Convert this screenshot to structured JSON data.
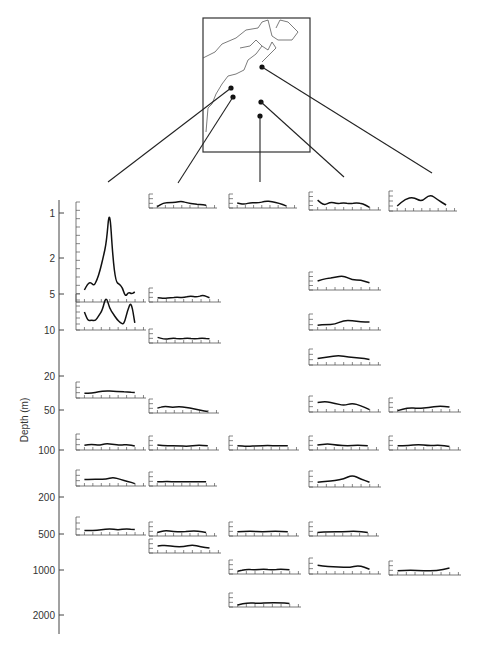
{
  "page_header": {
    "left": "",
    "center": ""
  },
  "chart_data": {
    "type": "line",
    "title": "",
    "xlabel": "",
    "ylabel": "Depth (m)",
    "yscale": "log-like (categorical ticks)",
    "y_ticks": [
      {
        "label": "1",
        "y": 213
      },
      {
        "label": "2",
        "y": 258
      },
      {
        "label": "5",
        "y": 294
      },
      {
        "label": "10",
        "y": 330
      },
      {
        "label": "20",
        "y": 376
      },
      {
        "label": "50",
        "y": 410
      },
      {
        "label": "100",
        "y": 450
      },
      {
        "label": "200",
        "y": 497
      },
      {
        "label": "500",
        "y": 534
      },
      {
        "label": "1000",
        "y": 570
      },
      {
        "label": "2000",
        "y": 615
      }
    ],
    "map": {
      "box": [
        203,
        18,
        310,
        152
      ],
      "stations": [
        {
          "id": "A",
          "x": 231,
          "y": 88,
          "column": 0
        },
        {
          "id": "B",
          "x": 233,
          "y": 97,
          "column": 1
        },
        {
          "id": "C",
          "x": 260,
          "y": 116,
          "column": 2
        },
        {
          "id": "D",
          "x": 261,
          "y": 102,
          "column": 3
        },
        {
          "id": "E",
          "x": 262,
          "y": 67,
          "column": 4
        }
      ],
      "leader_ends": [
        [
          108,
          182
        ],
        [
          178,
          183
        ],
        [
          260,
          182
        ],
        [
          344,
          177
        ],
        [
          432,
          173
        ]
      ]
    },
    "columns": [
      {
        "station": "A",
        "x": 76
      },
      {
        "station": "B",
        "x": 149
      },
      {
        "station": "C",
        "x": 228
      },
      {
        "station": "D",
        "x": 309
      },
      {
        "station": "E",
        "x": 389
      }
    ],
    "panels": [
      {
        "col": 0,
        "x": 76,
        "base": 302,
        "h": 100,
        "w": 70,
        "xticks": 8,
        "yticks": 12,
        "values": [
          0.12,
          0.18,
          0.2,
          0.16,
          0.22,
          0.32,
          0.45,
          0.6,
          0.95,
          0.45,
          0.2,
          0.18,
          0.15,
          0.05,
          0.1,
          0.08,
          0.1
        ]
      },
      {
        "col": 0,
        "x": 76,
        "base": 330,
        "h": 36,
        "w": 70,
        "xticks": 8,
        "yticks": 6,
        "values": [
          0.5,
          0.25,
          0.28,
          0.25,
          0.4,
          0.55,
          0.95,
          0.6,
          0.45,
          0.3,
          0.2,
          0.15,
          0.55,
          0.8,
          0.2
        ]
      },
      {
        "col": 0,
        "x": 76,
        "base": 398,
        "h": 16,
        "w": 70,
        "xticks": 8,
        "yticks": 3,
        "values": [
          0.3,
          0.3,
          0.4,
          0.45,
          0.42,
          0.4,
          0.38,
          0.35
        ]
      },
      {
        "col": 0,
        "x": 76,
        "base": 450,
        "h": 16,
        "w": 70,
        "xticks": 8,
        "yticks": 3,
        "values": [
          0.3,
          0.35,
          0.3,
          0.4,
          0.35,
          0.3,
          0.35,
          0.25
        ]
      },
      {
        "col": 0,
        "x": 76,
        "base": 486,
        "h": 16,
        "w": 70,
        "xticks": 8,
        "yticks": 3,
        "values": [
          0.4,
          0.42,
          0.42,
          0.42,
          0.55,
          0.4,
          0.3,
          0.15
        ]
      },
      {
        "col": 0,
        "x": 76,
        "base": 535,
        "h": 18,
        "w": 70,
        "xticks": 8,
        "yticks": 3,
        "values": [
          0.25,
          0.25,
          0.28,
          0.35,
          0.28,
          0.35,
          0.3
        ]
      },
      {
        "col": 1,
        "x": 149,
        "base": 208,
        "h": 14,
        "w": 68,
        "xticks": 8,
        "yticks": 3,
        "values": [
          0.1,
          0.35,
          0.4,
          0.4,
          0.5,
          0.35,
          0.3,
          0.25,
          0.2
        ]
      },
      {
        "col": 1,
        "x": 149,
        "base": 302,
        "h": 14,
        "w": 72,
        "xticks": 8,
        "yticks": 3,
        "values": [
          0.3,
          0.25,
          0.3,
          0.35,
          0.3,
          0.45,
          0.35,
          0.5,
          0.3
        ]
      },
      {
        "col": 1,
        "x": 149,
        "base": 343,
        "h": 14,
        "w": 72,
        "xticks": 8,
        "yticks": 3,
        "values": [
          0.4,
          0.25,
          0.35,
          0.3,
          0.35,
          0.3,
          0.35,
          0.3
        ]
      },
      {
        "col": 1,
        "x": 149,
        "base": 413,
        "h": 14,
        "w": 70,
        "xticks": 8,
        "yticks": 3,
        "values": [
          0.35,
          0.5,
          0.4,
          0.45,
          0.4,
          0.3,
          0.2,
          0.1
        ]
      },
      {
        "col": 1,
        "x": 149,
        "base": 450,
        "h": 14,
        "w": 70,
        "xticks": 8,
        "yticks": 3,
        "values": [
          0.35,
          0.3,
          0.3,
          0.25,
          0.35,
          0.3
        ]
      },
      {
        "col": 1,
        "x": 149,
        "base": 486,
        "h": 14,
        "w": 68,
        "xticks": 8,
        "yticks": 3,
        "values": [
          0.3,
          0.32,
          0.3,
          0.3,
          0.3,
          0.3
        ]
      },
      {
        "col": 1,
        "x": 149,
        "base": 536,
        "h": 14,
        "w": 68,
        "xticks": 8,
        "yticks": 3,
        "values": [
          0.25,
          0.4,
          0.3,
          0.3,
          0.35,
          0.35,
          0.25
        ]
      },
      {
        "col": 1,
        "x": 149,
        "base": 553,
        "h": 14,
        "w": 72,
        "xticks": 8,
        "yticks": 3,
        "values": [
          0.5,
          0.55,
          0.45,
          0.45,
          0.6,
          0.45,
          0.35
        ]
      },
      {
        "col": 2,
        "x": 229,
        "base": 208,
        "h": 14,
        "w": 68,
        "xticks": 8,
        "yticks": 3,
        "values": [
          0.35,
          0.25,
          0.4,
          0.35,
          0.5,
          0.45,
          0.35,
          0.15
        ]
      },
      {
        "col": 2,
        "x": 229,
        "base": 450,
        "h": 14,
        "w": 70,
        "xticks": 8,
        "yticks": 3,
        "values": [
          0.3,
          0.25,
          0.3,
          0.32,
          0.3,
          0.3
        ]
      },
      {
        "col": 2,
        "x": 229,
        "base": 536,
        "h": 14,
        "w": 70,
        "xticks": 8,
        "yticks": 3,
        "values": [
          0.3,
          0.35,
          0.3,
          0.35,
          0.3
        ]
      },
      {
        "col": 2,
        "x": 229,
        "base": 574,
        "h": 14,
        "w": 72,
        "xticks": 8,
        "yticks": 3,
        "values": [
          0.2,
          0.35,
          0.3,
          0.35,
          0.3,
          0.35,
          0.3
        ]
      },
      {
        "col": 2,
        "x": 229,
        "base": 607,
        "h": 14,
        "w": 72,
        "xticks": 8,
        "yticks": 3,
        "values": [
          0.15,
          0.3,
          0.25,
          0.3,
          0.3,
          0.25
        ]
      },
      {
        "col": 3,
        "x": 309,
        "base": 210,
        "h": 18,
        "w": 72,
        "xticks": 8,
        "yticks": 4,
        "values": [
          0.55,
          0.25,
          0.45,
          0.35,
          0.4,
          0.35,
          0.4,
          0.35,
          0.15
        ]
      },
      {
        "col": 3,
        "x": 309,
        "base": 290,
        "h": 18,
        "w": 72,
        "xticks": 8,
        "yticks": 4,
        "values": [
          0.5,
          0.65,
          0.7,
          0.8,
          0.55,
          0.55,
          0.4
        ]
      },
      {
        "col": 3,
        "x": 309,
        "base": 330,
        "h": 16,
        "w": 72,
        "xticks": 8,
        "yticks": 3,
        "values": [
          0.3,
          0.35,
          0.35,
          0.6,
          0.6,
          0.5,
          0.5
        ]
      },
      {
        "col": 3,
        "x": 309,
        "base": 365,
        "h": 16,
        "w": 72,
        "xticks": 8,
        "yticks": 3,
        "values": [
          0.4,
          0.5,
          0.6,
          0.5,
          0.45,
          0.35
        ]
      },
      {
        "col": 3,
        "x": 309,
        "base": 412,
        "h": 16,
        "w": 72,
        "xticks": 8,
        "yticks": 3,
        "values": [
          0.6,
          0.65,
          0.55,
          0.4,
          0.55,
          0.4,
          0.15
        ]
      },
      {
        "col": 3,
        "x": 309,
        "base": 450,
        "h": 14,
        "w": 70,
        "xticks": 8,
        "yticks": 3,
        "values": [
          0.35,
          0.45,
          0.35,
          0.3,
          0.35,
          0.3
        ]
      },
      {
        "col": 3,
        "x": 309,
        "base": 487,
        "h": 16,
        "w": 72,
        "xticks": 8,
        "yticks": 3,
        "values": [
          0.3,
          0.35,
          0.4,
          0.5,
          0.75,
          0.5,
          0.3
        ]
      },
      {
        "col": 3,
        "x": 309,
        "base": 536,
        "h": 14,
        "w": 70,
        "xticks": 8,
        "yticks": 3,
        "values": [
          0.25,
          0.3,
          0.3,
          0.35,
          0.25
        ]
      },
      {
        "col": 3,
        "x": 309,
        "base": 574,
        "h": 16,
        "w": 72,
        "xticks": 8,
        "yticks": 3,
        "values": [
          0.55,
          0.45,
          0.45,
          0.4,
          0.55,
          0.3
        ]
      },
      {
        "col": 4,
        "x": 389,
        "base": 211,
        "h": 20,
        "w": 68,
        "xticks": 8,
        "yticks": 4,
        "values": [
          0.25,
          0.6,
          0.7,
          0.45,
          0.85,
          0.55,
          0.3
        ]
      },
      {
        "col": 4,
        "x": 389,
        "base": 412,
        "h": 14,
        "w": 72,
        "xticks": 8,
        "yticks": 3,
        "values": [
          0.1,
          0.3,
          0.25,
          0.3,
          0.45,
          0.35
        ]
      },
      {
        "col": 4,
        "x": 389,
        "base": 450,
        "h": 14,
        "w": 72,
        "xticks": 8,
        "yticks": 3,
        "values": [
          0.3,
          0.3,
          0.4,
          0.3,
          0.35,
          0.25
        ]
      },
      {
        "col": 4,
        "x": 389,
        "base": 575,
        "h": 14,
        "w": 72,
        "xticks": 8,
        "yticks": 3,
        "values": [
          0.3,
          0.35,
          0.3,
          0.3,
          0.5
        ]
      }
    ]
  }
}
